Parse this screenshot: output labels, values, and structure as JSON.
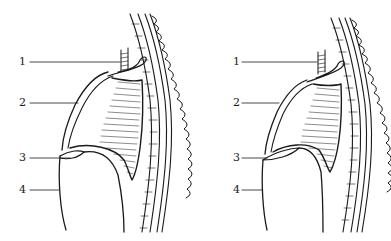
{
  "figures": [
    {
      "id": "left",
      "labels": [
        {
          "text": "1",
          "y": 56
        },
        {
          "text": "2",
          "y": 97
        },
        {
          "text": "3",
          "y": 152
        },
        {
          "text": "4",
          "y": 184
        }
      ]
    },
    {
      "id": "right",
      "labels": [
        {
          "text": "1",
          "y": 56
        },
        {
          "text": "2",
          "y": 97
        },
        {
          "text": "3",
          "y": 152
        },
        {
          "text": "4",
          "y": 184
        }
      ]
    }
  ],
  "colors": {
    "ink": "#1a1a1a",
    "background": "#ffffff"
  }
}
